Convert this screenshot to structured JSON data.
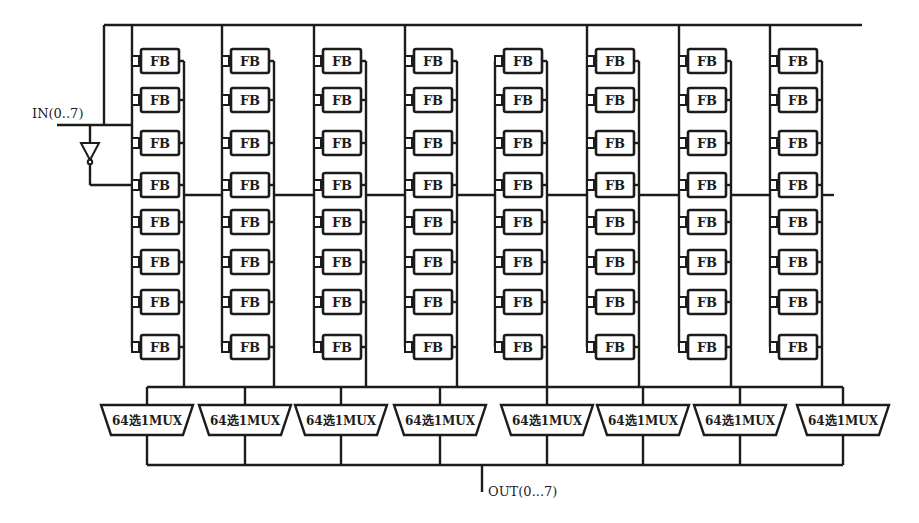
{
  "diagram": {
    "type": "FPGA-style array of function blocks with output multiplexers",
    "input_label": "IN(0..7)",
    "output_label": "OUT(0...7)",
    "block_label": "FB",
    "mux_label": "64选1MUX",
    "columns": 8,
    "rows_per_column": 8,
    "column_left_bus_x": [
      132,
      222,
      314,
      405,
      495,
      587,
      679,
      770
    ],
    "row_center_y": [
      61,
      100,
      143,
      185,
      222,
      262,
      302,
      347
    ],
    "column_connected_to_top_bus": [
      true,
      true,
      true,
      true,
      false,
      true,
      true,
      true
    ],
    "top_bus_y": 25,
    "middle_bus_y": 195,
    "mux_bus_y": 387,
    "mux_centers_x": [
      147,
      245,
      341,
      440,
      547,
      643,
      740,
      843
    ],
    "mux_top_y": 405,
    "mux_bottom_y": 435,
    "output_bus_y": 465,
    "output_tap_x": 482,
    "colors": {
      "line": "#1c1c1c",
      "background": "#ffffff"
    }
  }
}
